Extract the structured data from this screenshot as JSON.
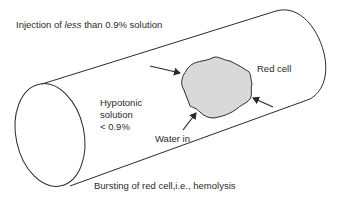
{
  "diagram": {
    "title_prefix": "Injection of ",
    "title_emphasis": "less",
    "title_suffix": " than 0.9% solution",
    "solution_label": [
      "Hypotonic",
      "solution",
      "< 0.9%"
    ],
    "cell_label": "Red cell",
    "water_label": "Water in",
    "caption": "Bursting of red cell,i.e., hemolysis",
    "colors": {
      "stroke": "#2a2a2a",
      "cell_fill": "#d9d9d9",
      "background": "#ffffff"
    }
  }
}
